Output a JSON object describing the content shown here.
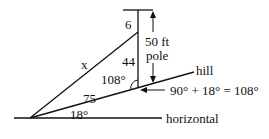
{
  "diagram": {
    "segment_top": "6",
    "segment_bottom": "44",
    "pole_label_line1": "50 ft",
    "pole_label_line2": "pole",
    "hypotenuse_label": "x",
    "angle_at_base_of_pole": "108°",
    "hill_length": "75",
    "hill_angle": "18°",
    "hill_label": "hill",
    "horizontal_label": "horizontal",
    "angle_equation": "90° + 18° = 108°"
  }
}
